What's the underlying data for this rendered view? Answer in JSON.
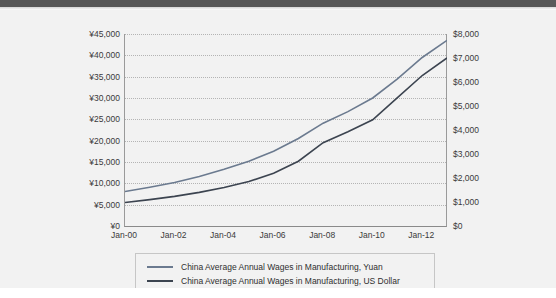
{
  "chart_data": {
    "type": "line",
    "title": "",
    "xlabel": "",
    "ylabel": "",
    "grid": true,
    "legend_position": "bottom",
    "x": [
      "Jan-00",
      "Jan-01",
      "Jan-02",
      "Jan-03",
      "Jan-04",
      "Jan-05",
      "Jan-06",
      "Jan-07",
      "Jan-08",
      "Jan-09",
      "Jan-10",
      "Jan-11",
      "Jan-12",
      "Jan-13"
    ],
    "x_tick_labels": [
      "Jan-00",
      "Jan-02",
      "Jan-04",
      "Jan-06",
      "Jan-08",
      "Jan-10",
      "Jan-12"
    ],
    "left_axis": {
      "label": "",
      "ylim": [
        0,
        45000
      ],
      "tick_labels": [
        "¥0",
        "¥5,000",
        "¥10,000",
        "¥15,000",
        "¥20,000",
        "¥25,000",
        "¥30,000",
        "¥35,000",
        "¥40,000",
        "¥45,000"
      ],
      "tick_values": [
        0,
        5000,
        10000,
        15000,
        20000,
        25000,
        30000,
        35000,
        40000,
        45000
      ],
      "currency_symbol": "¥"
    },
    "right_axis": {
      "label": "",
      "ylim": [
        0,
        8000
      ],
      "tick_labels": [
        "$0",
        "$1,000",
        "$2,000",
        "$3,000",
        "$4,000",
        "$5,000",
        "$6,000",
        "$7,000",
        "$8,000"
      ],
      "tick_values": [
        0,
        1000,
        2000,
        3000,
        4000,
        5000,
        6000,
        7000,
        8000
      ],
      "currency_symbol": "$"
    },
    "series": [
      {
        "name": "China Average Annual Wages in Manufacturing, Yuan",
        "axis": "left",
        "color": "#6b7a8f",
        "values": [
          8100,
          9100,
          10200,
          11600,
          13300,
          15200,
          17500,
          20500,
          24100,
          26800,
          30000,
          34500,
          39500,
          43500
        ]
      },
      {
        "name": "China Average Annual Wages in Manufacturing, US Dollar",
        "axis": "right",
        "color": "#3c4450",
        "values": [
          980,
          1100,
          1235,
          1400,
          1605,
          1850,
          2195,
          2700,
          3470,
          3925,
          4425,
          5345,
          6270,
          7000
        ]
      }
    ]
  },
  "legend": {
    "items": [
      {
        "label": "China Average Annual Wages in Manufacturing, Yuan"
      },
      {
        "label": "China Average Annual Wages in Manufacturing, US Dollar"
      }
    ]
  }
}
